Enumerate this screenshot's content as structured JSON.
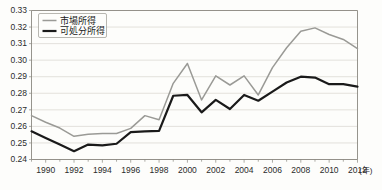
{
  "chart_data": {
    "type": "line",
    "title": "",
    "xlabel": "年",
    "ylabel": "",
    "xlim": [
      1989,
      2012
    ],
    "ylim": [
      0.24,
      0.33
    ],
    "grid": true,
    "legend_position": "top-left",
    "x": [
      1989,
      1990,
      1991,
      1992,
      1993,
      1994,
      1995,
      1996,
      1997,
      1998,
      1999,
      2000,
      2001,
      2002,
      2003,
      2004,
      2005,
      2006,
      2007,
      2008,
      2009,
      2010,
      2011,
      2012
    ],
    "xtick_labels": [
      "1990",
      "1992",
      "1994",
      "1996",
      "1998",
      "2000",
      "2002",
      "2004",
      "2006",
      "2008",
      "2010",
      "2012"
    ],
    "xtick_values": [
      1990,
      1992,
      1994,
      1996,
      1998,
      2000,
      2002,
      2004,
      2006,
      2008,
      2010,
      2012
    ],
    "ytick_labels": [
      "0.24",
      "0.25",
      "0.26",
      "0.27",
      "0.28",
      "0.29",
      "0.30",
      "0.31",
      "0.32",
      "0.33"
    ],
    "ytick_values": [
      0.24,
      0.25,
      0.26,
      0.27,
      0.28,
      0.29,
      0.3,
      0.31,
      0.32,
      0.33
    ],
    "series": [
      {
        "name": "市場所得",
        "color": "#9a9a96",
        "width": 1.5,
        "values": [
          0.2665,
          0.2625,
          0.259,
          0.254,
          0.2552,
          0.2557,
          0.2557,
          0.2588,
          0.2665,
          0.264,
          0.286,
          0.298,
          0.276,
          0.2905,
          0.285,
          0.2905,
          0.279,
          0.2955,
          0.3075,
          0.3175,
          0.3195,
          0.3155,
          0.3125,
          0.307
        ]
      },
      {
        "name": "可処分所得",
        "color": "#1a1a1a",
        "width": 2.2,
        "values": [
          0.257,
          0.253,
          0.249,
          0.245,
          0.249,
          0.2485,
          0.2495,
          0.2565,
          0.257,
          0.2573,
          0.2785,
          0.279,
          0.2685,
          0.276,
          0.2705,
          0.279,
          0.2755,
          0.281,
          0.2865,
          0.29,
          0.2895,
          0.2855,
          0.2855,
          0.284
        ]
      }
    ]
  },
  "legend": {
    "items": [
      {
        "label": "市場所得"
      },
      {
        "label": "可処分所得"
      }
    ]
  },
  "axis": {
    "x_unit": "(年)"
  }
}
